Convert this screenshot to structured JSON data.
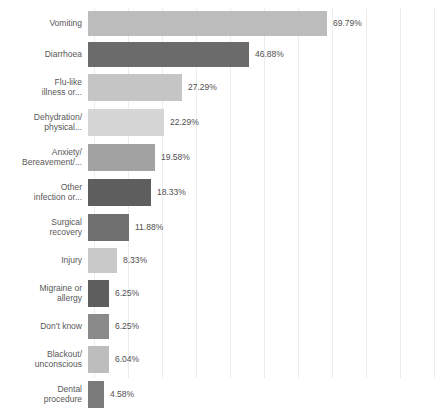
{
  "chart_data": {
    "type": "bar",
    "orientation": "horizontal",
    "title": "",
    "subtitle": "",
    "xlabel": "",
    "ylabel": "",
    "xlim": [
      0,
      100
    ],
    "grid": true,
    "grid_axis": "x",
    "legend": "none",
    "value_suffix": "%",
    "categories": [
      "Vomiting",
      "Diarrhoea",
      "Flu-like\nillness or...",
      "Dehydration/\nphysical...",
      "Anxiety/\nBereavement/...",
      "Other\ninfection or...",
      "Surgical\nrecovery",
      "Injury",
      "Migraine or\nallergy",
      "Don't know",
      "Blackout/\nunconscious",
      "Dental\nprocedure"
    ],
    "values": [
      69.79,
      46.88,
      27.29,
      22.29,
      19.58,
      18.33,
      11.88,
      8.33,
      6.25,
      6.25,
      6.04,
      4.58
    ],
    "value_labels": [
      "69.79%",
      "46.88%",
      "27.29%",
      "22.29%",
      "19.58%",
      "18.33%",
      "11.88%",
      "8.33%",
      "6.25%",
      "6.25%",
      "6.04%",
      "4.58%"
    ],
    "bar_colors": [
      "#bcbcbc",
      "#6b6b6b",
      "#c5c5c5",
      "#d6d6d6",
      "#a3a3a3",
      "#5e5e5e",
      "#6f6f6f",
      "#c9c9c9",
      "#5e5e5e",
      "#8a8a8a",
      "#bdbdbd",
      "#7a7a7a"
    ],
    "gridline_color": "#ececec",
    "background_color": "#ffffff",
    "label_color": "#585858",
    "value_color": "#4f4f4f"
  },
  "bars": [
    {
      "label": "Vomiting",
      "value_label": "69.79%",
      "value": 69.79,
      "color": "#bcbcbc",
      "lines": 1
    },
    {
      "label": "Diarrhoea",
      "value_label": "46.88%",
      "value": 46.88,
      "color": "#6b6b6b",
      "lines": 1
    },
    {
      "label": "Flu-like\nillness or...",
      "value_label": "27.29%",
      "value": 27.29,
      "color": "#c5c5c5",
      "lines": 2
    },
    {
      "label": "Dehydration/\nphysical...",
      "value_label": "22.29%",
      "value": 22.29,
      "color": "#d6d6d6",
      "lines": 2
    },
    {
      "label": "Anxiety/\nBereavement/...",
      "value_label": "19.58%",
      "value": 19.58,
      "color": "#a3a3a3",
      "lines": 2
    },
    {
      "label": "Other\ninfection or...",
      "value_label": "18.33%",
      "value": 18.33,
      "color": "#5e5e5e",
      "lines": 2
    },
    {
      "label": "Surgical\nrecovery",
      "value_label": "11.88%",
      "value": 11.88,
      "color": "#6f6f6f",
      "lines": 2
    },
    {
      "label": "Injury",
      "value_label": "8.33%",
      "value": 8.33,
      "color": "#c9c9c9",
      "lines": 1
    },
    {
      "label": "Migraine or\nallergy",
      "value_label": "6.25%",
      "value": 6.25,
      "color": "#5e5e5e",
      "lines": 2
    },
    {
      "label": "Don't know",
      "value_label": "6.25%",
      "value": 6.25,
      "color": "#8a8a8a",
      "lines": 1
    },
    {
      "label": "Blackout/\nunconscious",
      "value_label": "6.04%",
      "value": 6.04,
      "color": "#bdbdbd",
      "lines": 2
    },
    {
      "label": "Dental\nprocedure",
      "value_label": "4.58%",
      "value": 4.58,
      "color": "#7a7a7a",
      "lines": 2
    }
  ],
  "layout": {
    "plot_left_px": 94,
    "plot_right_px": 437,
    "gridline_count": 11,
    "gridline_spacing_px": 34,
    "max_value_for_scale": 100
  }
}
